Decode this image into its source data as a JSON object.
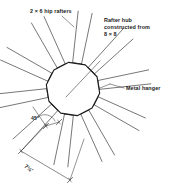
{
  "figure": {
    "type": "technical-drawing",
    "background_color": "#ffffff",
    "line_color": "#3c3c3c",
    "text_color": "#1a1a1a"
  },
  "labels": {
    "rafters": "2 × 6 hip rafters",
    "hub": "Rafter hub constructed from 8 × 8",
    "hanger": "Metal hanger",
    "angle": "45°",
    "dimension": "7½'"
  },
  "geometry": {
    "hub": {
      "center_x": 73,
      "center_y": 89,
      "radius": 27,
      "sides": 10,
      "rotation_deg": 9
    },
    "rafters": {
      "count": 10,
      "inner_radius": 27,
      "outer_radius": 78,
      "half_width_deg": 5.2
    },
    "dimension_line": {
      "label": "7½'",
      "tick_style": "slash"
    },
    "angle_marker": {
      "label": "45°",
      "vertex_x": 46,
      "vertex_y": 126
    }
  }
}
